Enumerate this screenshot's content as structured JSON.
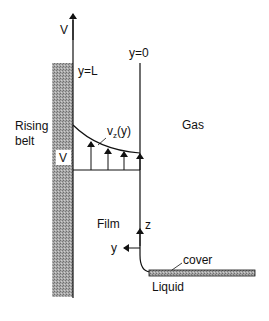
{
  "diagram": {
    "title": "",
    "labels": {
      "belt_velocity": "V",
      "y_top": "y=L",
      "y_zero": "y=0",
      "rising_belt_line1": "Rising",
      "rising_belt_line2": "belt",
      "belt_speed_box": "V",
      "profile_main": "v",
      "profile_sub": "z",
      "profile_arg": "(y)",
      "gas": "Gas",
      "film": "Film",
      "z_axis": "z",
      "y_axis": "y",
      "cover": "cover",
      "liquid": "Liquid"
    },
    "colors": {
      "line": "#111111",
      "belt_fill": "#9a9a9a",
      "background": "#ffffff"
    }
  }
}
